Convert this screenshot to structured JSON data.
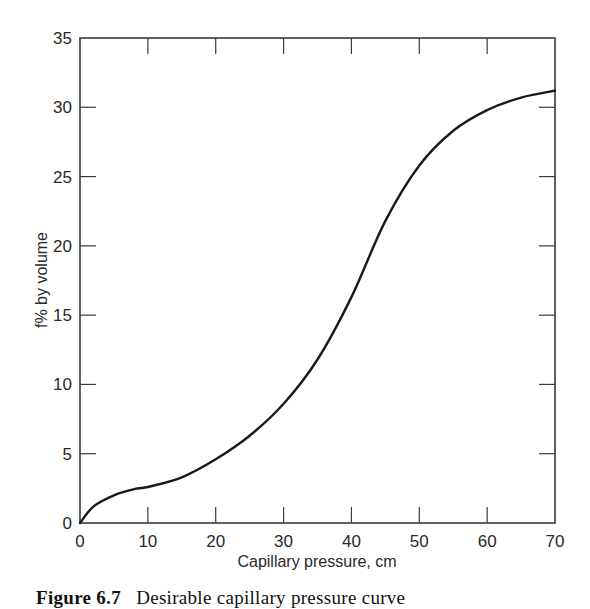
{
  "chart_data": {
    "type": "line",
    "title": "",
    "xlabel": "Capillary pressure, cm",
    "ylabel": "f% by volume",
    "xlim": [
      0,
      70
    ],
    "ylim": [
      0,
      35
    ],
    "xticks": [
      0,
      10,
      20,
      30,
      40,
      50,
      60,
      70
    ],
    "yticks": [
      0,
      5,
      10,
      15,
      20,
      25,
      30,
      35
    ],
    "grid": false,
    "legend": null,
    "series": [
      {
        "name": "capillary pressure curve",
        "x": [
          0,
          2,
          5,
          8,
          10,
          15,
          20,
          25,
          30,
          35,
          40,
          45,
          50,
          55,
          60,
          65,
          70
        ],
        "y": [
          0,
          1.2,
          2.0,
          2.45,
          2.6,
          3.3,
          4.6,
          6.3,
          8.6,
          11.8,
          16.3,
          21.8,
          25.8,
          28.3,
          29.8,
          30.7,
          31.2
        ]
      }
    ]
  },
  "axes": {
    "x_title": "Capillary pressure, cm",
    "y_title": "f% by volume",
    "x_tick_labels": [
      "0",
      "10",
      "20",
      "30",
      "40",
      "50",
      "60",
      "70"
    ],
    "y_tick_labels": [
      "0",
      "5",
      "10",
      "15",
      "20",
      "25",
      "30",
      "35"
    ]
  },
  "caption": {
    "label": "Figure 6.7",
    "text": "Desirable capillary pressure curve"
  },
  "colors": {
    "line": "#1a1a1a",
    "frame": "#3a3a3a",
    "background": "#ffffff"
  }
}
